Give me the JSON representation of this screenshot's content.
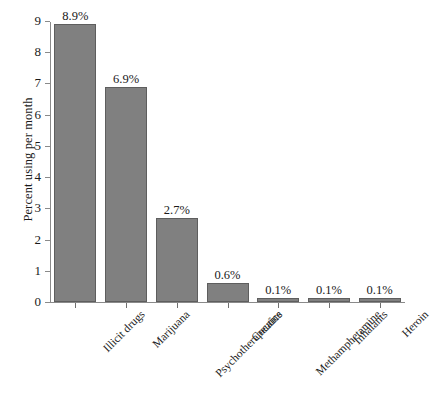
{
  "chart_data": {
    "type": "bar",
    "title": "",
    "xlabel": "",
    "ylabel": "Percent using per month",
    "ylim": [
      0,
      9
    ],
    "grid": false,
    "legend": false,
    "bar_color": "#808080",
    "bar_edge_color": "#5e5e5e",
    "axis_color": "#8a8a8a",
    "background": "#ffffff",
    "categories": [
      "Illicit drugs",
      "Marijuana",
      "Psychotherapeutics",
      "Cocaine",
      "Methamphetamine",
      "Inhalants",
      "Heroin"
    ],
    "values": [
      8.9,
      6.9,
      2.7,
      0.6,
      0.1,
      0.1,
      0.1
    ],
    "data_labels": [
      "8.9%",
      "6.9%",
      "2.7%",
      "0.6%",
      "0.1%",
      "0.1%",
      "0.1%"
    ],
    "y_ticks": [
      0,
      1,
      2,
      3,
      4,
      5,
      6,
      7,
      8,
      9
    ],
    "y_tick_labels": [
      "0",
      "1",
      "2",
      "3",
      "4",
      "5",
      "6",
      "7",
      "8",
      "9"
    ]
  }
}
